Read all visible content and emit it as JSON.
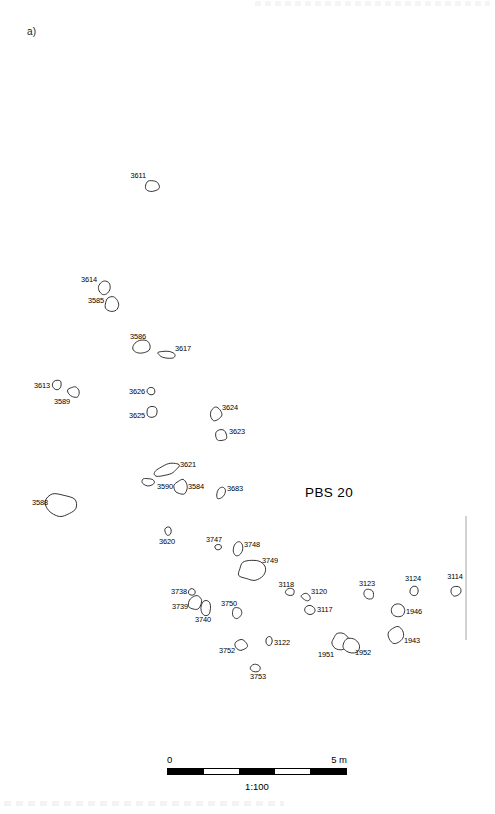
{
  "figure": {
    "panel_letter": "a)",
    "site_title": "PBS 20",
    "scale": {
      "start_label": "0",
      "end_label": "5 m",
      "ratio_label": "1:100",
      "segments": [
        "on",
        "off",
        "on",
        "off",
        "on"
      ]
    }
  },
  "chart_data": {
    "type": "scatter",
    "title": "PBS 20",
    "xlabel": "",
    "ylabel": "",
    "xlim": [
      0,
      495
    ],
    "ylim": [
      0,
      760
    ],
    "grid": false,
    "legend": "none",
    "features": [
      {
        "id": "3611",
        "cx": 152,
        "cy": 186,
        "label_x": 146,
        "label_y": 178,
        "label_anchor": "r"
      },
      {
        "id": "3614",
        "cx": 104,
        "cy": 288,
        "label_x": 97,
        "label_y": 282,
        "label_anchor": "r"
      },
      {
        "id": "3585",
        "cx": 112,
        "cy": 304,
        "label_x": 104,
        "label_y": 303,
        "label_anchor": "r"
      },
      {
        "id": "3586",
        "cx": 141,
        "cy": 347,
        "label_x": 146,
        "label_y": 339,
        "label_anchor": "r"
      },
      {
        "id": "3617",
        "cx": 167,
        "cy": 355,
        "label_x": 175,
        "label_y": 351,
        "label_anchor": "l"
      },
      {
        "id": "3613",
        "cx": 57,
        "cy": 385,
        "label_x": 50,
        "label_y": 388,
        "label_anchor": "r"
      },
      {
        "id": "3589",
        "cx": 74,
        "cy": 392,
        "label_x": 70,
        "label_y": 404,
        "label_anchor": "r"
      },
      {
        "id": "3626",
        "cx": 151,
        "cy": 391,
        "label_x": 145,
        "label_y": 394,
        "label_anchor": "r"
      },
      {
        "id": "3625",
        "cx": 152,
        "cy": 412,
        "label_x": 145,
        "label_y": 418,
        "label_anchor": "r"
      },
      {
        "id": "3624",
        "cx": 216,
        "cy": 414,
        "label_x": 222,
        "label_y": 410,
        "label_anchor": "l"
      },
      {
        "id": "3623",
        "cx": 221,
        "cy": 435,
        "label_x": 229,
        "label_y": 434,
        "label_anchor": "l"
      },
      {
        "id": "3621",
        "cx": 166,
        "cy": 470,
        "label_x": 180,
        "label_y": 467,
        "label_anchor": "l"
      },
      {
        "id": "3590",
        "cx": 148,
        "cy": 482,
        "label_x": 157,
        "label_y": 489,
        "label_anchor": "l"
      },
      {
        "id": "3584",
        "cx": 181,
        "cy": 487,
        "label_x": 188,
        "label_y": 489,
        "label_anchor": "l"
      },
      {
        "id": "3683",
        "cx": 221,
        "cy": 493,
        "label_x": 227,
        "label_y": 491,
        "label_anchor": "l"
      },
      {
        "id": "3588",
        "cx": 62,
        "cy": 505,
        "label_x": 48,
        "label_y": 505,
        "label_anchor": "r"
      },
      {
        "id": "3620",
        "cx": 168,
        "cy": 531,
        "label_x": 167,
        "label_y": 544,
        "label_anchor": "m"
      },
      {
        "id": "3747",
        "cx": 218,
        "cy": 547,
        "label_x": 222,
        "label_y": 542,
        "label_anchor": "r"
      },
      {
        "id": "3748",
        "cx": 238,
        "cy": 549,
        "label_x": 244,
        "label_y": 547,
        "label_anchor": "l"
      },
      {
        "id": "3749",
        "cx": 251,
        "cy": 570,
        "label_x": 262,
        "label_y": 563,
        "label_anchor": "l"
      },
      {
        "id": "3738",
        "cx": 192,
        "cy": 592,
        "label_x": 187,
        "label_y": 594,
        "label_anchor": "r"
      },
      {
        "id": "3739",
        "cx": 195,
        "cy": 603,
        "label_x": 188,
        "label_y": 609,
        "label_anchor": "r"
      },
      {
        "id": "3740",
        "cx": 206,
        "cy": 608,
        "label_x": 203,
        "label_y": 622,
        "label_anchor": "m"
      },
      {
        "id": "3118",
        "cx": 290,
        "cy": 592,
        "label_x": 294,
        "label_y": 587,
        "label_anchor": "r"
      },
      {
        "id": "3120",
        "cx": 306,
        "cy": 597,
        "label_x": 311,
        "label_y": 594,
        "label_anchor": "l"
      },
      {
        "id": "3117",
        "cx": 310,
        "cy": 610,
        "label_x": 317,
        "label_y": 612,
        "label_anchor": "l"
      },
      {
        "id": "3123",
        "cx": 369,
        "cy": 594,
        "label_x": 367,
        "label_y": 586,
        "label_anchor": "m"
      },
      {
        "id": "3124",
        "cx": 414,
        "cy": 591,
        "label_x": 413,
        "label_y": 581,
        "label_anchor": "m"
      },
      {
        "id": "3114",
        "cx": 456,
        "cy": 591,
        "label_x": 455,
        "label_y": 579,
        "label_anchor": "m"
      },
      {
        "id": "3750",
        "cx": 237,
        "cy": 613,
        "label_x": 237,
        "label_y": 606,
        "label_anchor": "r"
      },
      {
        "id": "1946",
        "cx": 398,
        "cy": 610,
        "label_x": 406,
        "label_y": 614,
        "label_anchor": "l"
      },
      {
        "id": "1943",
        "cx": 396,
        "cy": 635,
        "label_x": 404,
        "label_y": 643,
        "label_anchor": "l"
      },
      {
        "id": "3752",
        "cx": 241,
        "cy": 645,
        "label_x": 235,
        "label_y": 653,
        "label_anchor": "r"
      },
      {
        "id": "3122",
        "cx": 269,
        "cy": 641,
        "label_x": 274,
        "label_y": 645,
        "label_anchor": "l"
      },
      {
        "id": "1951",
        "cx": 341,
        "cy": 641,
        "label_x": 334,
        "label_y": 657,
        "label_anchor": "r"
      },
      {
        "id": "1952",
        "cx": 347,
        "cy": 644,
        "label_x": 355,
        "label_y": 655,
        "label_anchor": "l"
      },
      {
        "id": "3753",
        "cx": 255,
        "cy": 668,
        "label_x": 258,
        "label_y": 679,
        "label_anchor": "m"
      }
    ],
    "trench_edge": {
      "x": 466,
      "y_top": 516,
      "y_bottom": 640
    }
  }
}
